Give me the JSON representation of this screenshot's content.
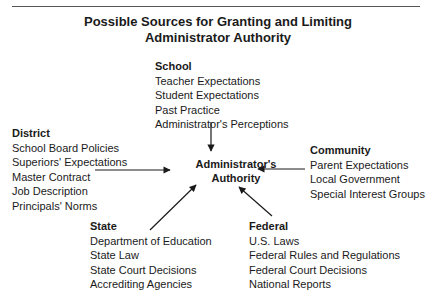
{
  "title": {
    "line1": "Possible Sources for Granting and Limiting",
    "line2": "Administrator Authority"
  },
  "center": {
    "line1": "Administrator's",
    "line2": "Authority"
  },
  "groups": {
    "school": {
      "heading": "School",
      "items": [
        "Teacher Expectations",
        "Student Expectations",
        "Past Practice",
        "Administrator's Perceptions"
      ]
    },
    "district": {
      "heading": "District",
      "items": [
        "School Board Policies",
        "Superiors' Expectations",
        "Master Contract",
        "Job Description",
        "Principals' Norms"
      ]
    },
    "community": {
      "heading": "Community",
      "items": [
        "Parent Expectations",
        "Local Government",
        "Special Interest Groups"
      ]
    },
    "state": {
      "heading": "State",
      "items": [
        "Department of Education",
        "State Law",
        "State Court Decisions",
        "Accrediting Agencies"
      ]
    },
    "federal": {
      "heading": "Federal",
      "items": [
        "U.S. Laws",
        "Federal Rules and Regulations",
        "Federal Court Decisions",
        "National Reports"
      ]
    }
  }
}
